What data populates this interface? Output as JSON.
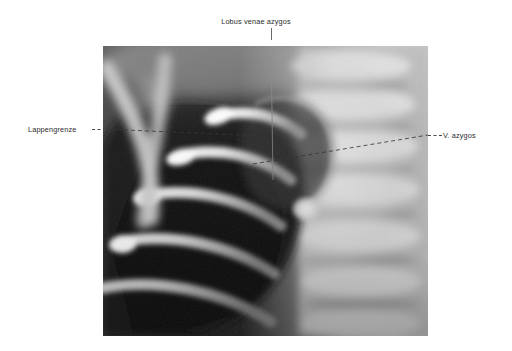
{
  "figure": {
    "kind": "chest-radiograph",
    "plate": {
      "left": 103,
      "top": 46,
      "width": 325,
      "height": 290
    },
    "background_color": "#ffffff",
    "label_color": "#2b2b2b",
    "leader_color": "#4a4a4a"
  },
  "annotations": [
    {
      "id": "lobus-venae-azygos",
      "text": "Lobus venae azygos",
      "position": "top-center",
      "leader": "vertical-solid"
    },
    {
      "id": "lappengrenze",
      "text": "Lappengrenze",
      "position": "left",
      "leader": "horizontal-dashed"
    },
    {
      "id": "v-azygos",
      "text": "V. azygos",
      "position": "right",
      "leader": "horizontal-dashed"
    }
  ]
}
